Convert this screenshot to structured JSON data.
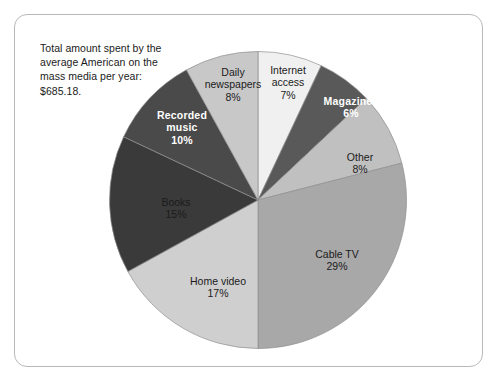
{
  "figure": {
    "caption_lines": [
      "Total amount spent by the",
      "average American on the",
      "mass media per year:",
      "$685.18."
    ],
    "frame_color": "#b9b9b9",
    "background": "#ffffff"
  },
  "chart_data": {
    "type": "pie",
    "title": "Total amount spent by the average American on the mass media per year: $685.18.",
    "total_label": "$685.18",
    "xlabel": "",
    "ylabel": "",
    "grid": false,
    "legend": "none",
    "labels_inside": true,
    "start_angle_deg": 0,
    "direction": "clockwise",
    "categories": [
      "Internet access",
      "Magazines",
      "Other",
      "Cable TV",
      "Home video",
      "Books",
      "Recorded music",
      "Daily newspapers"
    ],
    "values": [
      7,
      6,
      8,
      29,
      17,
      15,
      10,
      8
    ],
    "value_labels": [
      "7%",
      "6%",
      "8%",
      "29%",
      "17%",
      "15%",
      "10%",
      "8%"
    ],
    "colors": [
      "#f0f0f0",
      "#595959",
      "#c0c0c0",
      "#a8a8a8",
      "#cfcfcf",
      "#3a3a3a",
      "#4a4a4a",
      "#c8c8c8"
    ],
    "slices": [
      {
        "name": "Internet access",
        "name_lines": [
          "Internet",
          "access"
        ],
        "percent_label": "7%",
        "value": 7,
        "color": "#f0f0f0",
        "text_color": "dark",
        "label_x": 273,
        "label_y": 68
      },
      {
        "name": "Magazines",
        "name_lines": [
          "Magazines"
        ],
        "percent_label": "6%",
        "value": 6,
        "color": "#595959",
        "text_color": "light",
        "label_x": 336,
        "label_y": 92
      },
      {
        "name": "Other",
        "name_lines": [
          "Other"
        ],
        "percent_label": "8%",
        "value": 8,
        "color": "#c0c0c0",
        "text_color": "dark",
        "label_x": 345,
        "label_y": 148
      },
      {
        "name": "Cable TV",
        "name_lines": [
          "Cable TV"
        ],
        "percent_label": "29%",
        "value": 29,
        "color": "#a8a8a8",
        "text_color": "dark",
        "label_x": 322,
        "label_y": 245
      },
      {
        "name": "Home video",
        "name_lines": [
          "Home video"
        ],
        "percent_label": "17%",
        "value": 17,
        "color": "#cfcfcf",
        "text_color": "dark",
        "label_x": 203,
        "label_y": 272
      },
      {
        "name": "Books",
        "name_lines": [
          "Books"
        ],
        "percent_label": "15%",
        "value": 15,
        "color": "#3a3a3a",
        "text_color": "dark",
        "label_x": 161,
        "label_y": 193
      },
      {
        "name": "Recorded music",
        "name_lines": [
          "Recorded",
          "music"
        ],
        "percent_label": "10%",
        "value": 10,
        "color": "#4a4a4a",
        "text_color": "light",
        "label_x": 167,
        "label_y": 113
      },
      {
        "name": "Daily newspapers",
        "name_lines": [
          "Daily",
          "newspapers"
        ],
        "percent_label": "8%",
        "value": 8,
        "color": "#c8c8c8",
        "text_color": "dark",
        "label_x": 218,
        "label_y": 70
      }
    ]
  }
}
